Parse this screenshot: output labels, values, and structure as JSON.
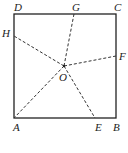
{
  "figure": {
    "type": "geometry",
    "square": {
      "corners": [
        "A",
        "B",
        "C",
        "D"
      ]
    },
    "points": {
      "A": {
        "label": "A",
        "x": 14,
        "y": 118
      },
      "B": {
        "label": "B",
        "x": 116,
        "y": 118
      },
      "C": {
        "label": "C",
        "x": 116,
        "y": 14
      },
      "D": {
        "label": "D",
        "x": 14,
        "y": 14
      },
      "E": {
        "label": "E",
        "x": 95,
        "y": 118
      },
      "F": {
        "label": "F",
        "x": 116,
        "y": 56
      },
      "G": {
        "label": "G",
        "x": 74,
        "y": 14
      },
      "H": {
        "label": "H",
        "x": 14,
        "y": 36
      },
      "O": {
        "label": "O",
        "x": 64,
        "y": 66
      }
    },
    "dashed_segments": [
      [
        "O",
        "A"
      ],
      [
        "O",
        "E"
      ],
      [
        "O",
        "F"
      ],
      [
        "O",
        "G"
      ],
      [
        "O",
        "H"
      ]
    ]
  }
}
